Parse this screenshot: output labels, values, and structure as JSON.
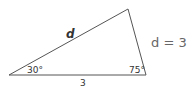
{
  "diagram": {
    "type": "triangle",
    "side_label_hyp": "d",
    "side_label_base": "3",
    "angle_left": "30°",
    "angle_right": "75°"
  },
  "answer": "d = 3",
  "colors": {
    "line": "#555555",
    "text": "#333333",
    "answer": "#666666"
  }
}
